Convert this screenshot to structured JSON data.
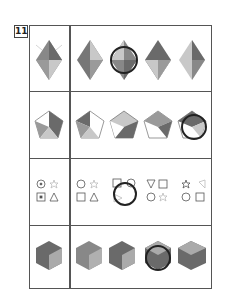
{
  "question_number": "11",
  "rows": [
    {
      "name": "diamond-row",
      "given": "diamond",
      "options": [
        "diamond-1",
        "diamond-2-circled",
        "diamond-3",
        "diamond-4"
      ],
      "circled_option": 2
    },
    {
      "name": "pentagon-row",
      "given": "pentagon",
      "options": [
        "pentagon-1",
        "pentagon-2",
        "pentagon-3",
        "pentagon-4-circled"
      ],
      "circled_option": 4
    },
    {
      "name": "symbols-row",
      "given": "circle-star-square-triangle",
      "options": [
        "symbols-1",
        "symbols-2-circled",
        "symbols-3",
        "symbols-4"
      ],
      "circled_option": 2
    },
    {
      "name": "hexagon-row",
      "given": "hexagon",
      "options": [
        "hexagon-1",
        "hexagon-2",
        "hexagon-3-circled",
        "hexagon-4"
      ],
      "circled_option": 3
    }
  ],
  "labels": {
    "a": "黄",
    "b": "赤",
    "c": "青",
    "d": "黄色"
  },
  "colors": {
    "dark": "#6a6a6a",
    "mid": "#9a9a9a",
    "light": "#c8c8c8",
    "frame": "#555555",
    "circle": "#222222"
  }
}
